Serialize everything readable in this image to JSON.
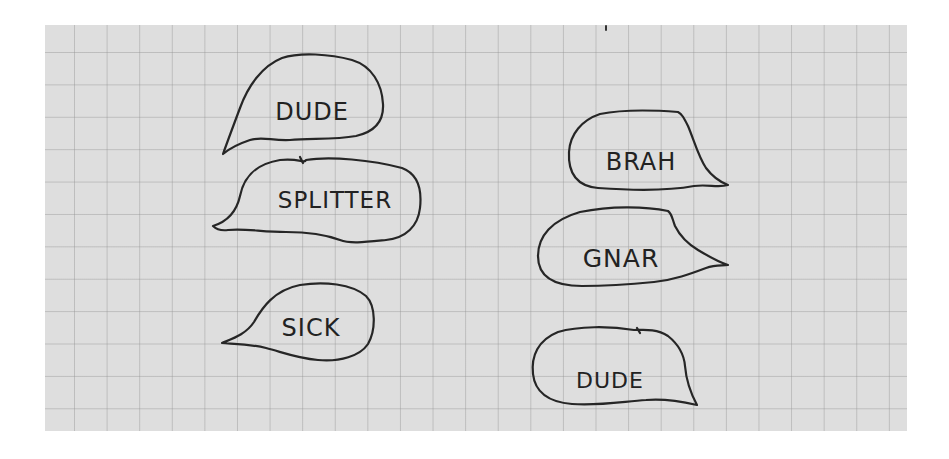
{
  "canvas": {
    "width": 949,
    "height": 459,
    "background": "#ffffff"
  },
  "paper": {
    "type": "grid-paper",
    "color": "#dedede",
    "grid_color": "#b8b8b8",
    "left": 45,
    "top": 25,
    "width": 862,
    "height": 406
  },
  "ink_color": "#262626",
  "bubbles": [
    {
      "id": "dude-left",
      "label": "DUDE",
      "column": "left",
      "tail_direction": "down-left",
      "label_x": 312,
      "label_y": 112,
      "font_size": 24
    },
    {
      "id": "splitter",
      "label": "SPLITTER",
      "column": "left",
      "tail_direction": "left",
      "label_x": 335,
      "label_y": 200,
      "font_size": 23
    },
    {
      "id": "sick",
      "label": "SICK",
      "column": "left",
      "tail_direction": "left",
      "label_x": 311,
      "label_y": 328,
      "font_size": 24
    },
    {
      "id": "brah",
      "label": "BRAH",
      "column": "right",
      "tail_direction": "right",
      "label_x": 641,
      "label_y": 162,
      "font_size": 24
    },
    {
      "id": "gnar",
      "label": "GNAR",
      "column": "right",
      "tail_direction": "right",
      "label_x": 621,
      "label_y": 258,
      "font_size": 25
    },
    {
      "id": "dude-right",
      "label": "DUDE",
      "column": "right",
      "tail_direction": "down-right",
      "label_x": 610,
      "label_y": 381,
      "font_size": 22
    }
  ]
}
